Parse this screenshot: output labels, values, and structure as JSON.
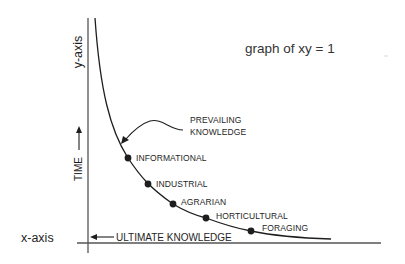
{
  "title": "graph of xy = 1",
  "axes": {
    "x_label": "x-axis",
    "y_label": "y-axis",
    "x_annotation": "ULTIMATE KNOWLEDGE",
    "y_annotation": "TIME"
  },
  "curve": {
    "equation": "xy = 1",
    "label_lines": [
      "PREVAILING",
      "KNOWLEDGE"
    ]
  },
  "stages": [
    {
      "label": "INFORMATIONAL"
    },
    {
      "label": "INDUSTRIAL"
    },
    {
      "label": "AGRARIAN"
    },
    {
      "label": "HORTICULTURAL"
    },
    {
      "label": "FORAGING"
    }
  ],
  "colors": {
    "ink": "#1e1e1e",
    "axis": "#555555",
    "background": "#ffffff"
  }
}
